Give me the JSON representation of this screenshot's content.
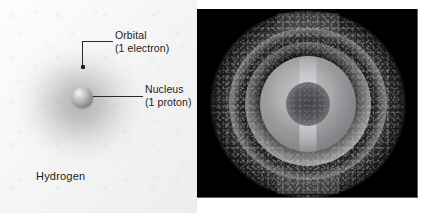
{
  "figure": {
    "width": 433,
    "height": 213,
    "background_color": "#ffffff"
  },
  "left_panel": {
    "name": "hydrogen-atom-diagram",
    "caption": "Hydrogen",
    "background_color": "#f5f5f5",
    "cloud_color": "#8a8a8c",
    "callouts": [
      {
        "title": "Orbital",
        "subtitle": "(1 electron)",
        "points_to": "electron-dot"
      },
      {
        "title": "Nucleus",
        "subtitle": "(1 proton)",
        "points_to": "nucleus-sphere"
      }
    ],
    "parts": {
      "nucleus_label": "Nucleus",
      "nucleus_sublabel": "(1 proton)",
      "orbital_label": "Orbital",
      "orbital_sublabel": "(1 electron)",
      "nucleus_color": "#a8a8a8",
      "electron_color": "#1a1a1a",
      "leader_line_color": "#2b2b2b"
    }
  },
  "right_panel": {
    "name": "electron-density-visualization",
    "background_color": "#000000",
    "glow_color": "#e4e4e7",
    "core_color": "#4a4a4e",
    "description": "Concentric shells of a computed hydrogen orbital rendered as a bright speckled sphere on black"
  }
}
